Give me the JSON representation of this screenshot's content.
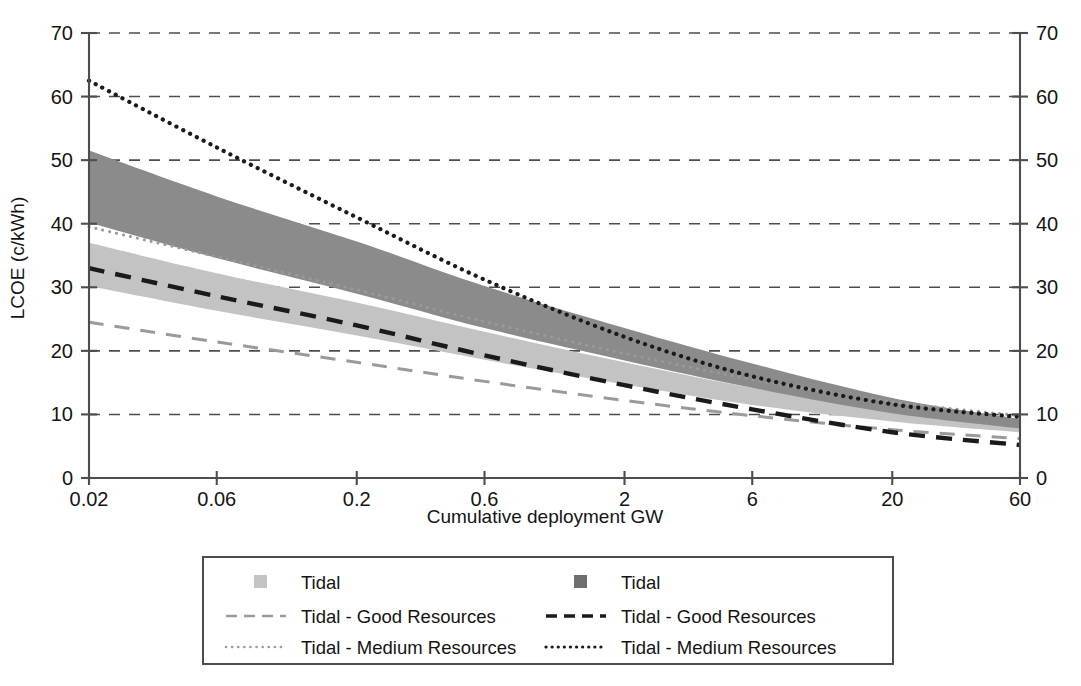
{
  "chart_data": {
    "type": "area",
    "title": "",
    "xlabel": "Cumulative deployment GW",
    "ylabel": "LCOE (c/kWh)",
    "xscale": "log",
    "xlim": [
      0.02,
      60
    ],
    "ylim": [
      0,
      70
    ],
    "grid": true,
    "xticks": [
      "0.02",
      "0.06",
      "0.2",
      "0.6",
      "2",
      "6",
      "20",
      "60"
    ],
    "xtick_values": [
      0.02,
      0.06,
      0.2,
      0.6,
      2,
      6,
      20,
      60
    ],
    "yticks": [
      "0",
      "10",
      "20",
      "30",
      "40",
      "50",
      "60",
      "70"
    ],
    "ytick_values": [
      0,
      10,
      20,
      30,
      40,
      50,
      60,
      70
    ],
    "yticks_right": [
      "0",
      "10",
      "20",
      "30",
      "40",
      "50",
      "60",
      "70"
    ],
    "legend_position": "below",
    "colors": {
      "band_light": "#c3c3c3",
      "band_dark": "#8b8b8b",
      "line_light": "#9a9a9a",
      "line_dark": "#1a1a1a",
      "axis": "#4d4d4d",
      "grid": "#4d4d4d",
      "text": "#141414",
      "legend_border": "#4d4d4d",
      "background": "#ffffff"
    },
    "series": [
      {
        "name": "Tidal",
        "type": "band",
        "style": "light-fill",
        "color": "#c3c3c3",
        "x": [
          0.02,
          0.06,
          0.2,
          0.6,
          2,
          6,
          20,
          60
        ],
        "upper": [
          37.0,
          32.2,
          27.6,
          23.0,
          18.2,
          14.2,
          10.8,
          8.6
        ],
        "lower": [
          30.2,
          26.3,
          22.4,
          18.6,
          14.7,
          11.5,
          8.9,
          7.2
        ]
      },
      {
        "name": "Tidal",
        "type": "band",
        "style": "dark-fill",
        "color": "#8b8b8b",
        "x": [
          0.02,
          0.06,
          0.2,
          0.6,
          2,
          6,
          20,
          60
        ],
        "upper": [
          51.5,
          44.3,
          37.2,
          30.2,
          23.6,
          18.0,
          12.6,
          9.3
        ],
        "lower": [
          40.2,
          34.6,
          29.0,
          23.6,
          18.5,
          14.2,
          10.2,
          7.8
        ]
      },
      {
        "name": "Tidal - Good Resources",
        "type": "line",
        "style": "dashed",
        "color": "#9a9a9a",
        "x": [
          0.02,
          0.06,
          0.2,
          0.6,
          2,
          6,
          20,
          60
        ],
        "values": [
          24.5,
          21.4,
          18.2,
          15.2,
          12.2,
          9.8,
          7.6,
          6.2
        ]
      },
      {
        "name": "Tidal - Good Resources",
        "type": "line",
        "style": "dashed",
        "color": "#1a1a1a",
        "x": [
          0.02,
          0.06,
          0.2,
          0.6,
          2,
          6,
          20,
          60
        ],
        "values": [
          33.0,
          28.6,
          24.0,
          19.3,
          14.6,
          10.8,
          7.2,
          5.2
        ]
      },
      {
        "name": "Tidal - Medium Resources",
        "type": "line",
        "style": "dotted",
        "color": "#9a9a9a",
        "x": [
          0.02,
          0.06,
          0.2,
          0.6,
          2,
          6,
          20,
          60
        ],
        "values": [
          39.5,
          34.8,
          29.6,
          24.6,
          19.6,
          15.5,
          12.0,
          9.8
        ]
      },
      {
        "name": "Tidal - Medium Resources",
        "type": "line",
        "style": "dotted",
        "color": "#1a1a1a",
        "x": [
          0.02,
          0.06,
          0.2,
          0.6,
          2,
          6,
          20,
          60
        ],
        "values": [
          62.5,
          52.0,
          41.0,
          31.2,
          22.2,
          16.0,
          11.6,
          9.6
        ]
      }
    ],
    "legend": {
      "columns": [
        {
          "key": "light",
          "entries": [
            {
              "label": "Tidal",
              "marker": "square",
              "color": "#c3c3c3"
            },
            {
              "label": "Tidal - Good Resources",
              "marker": "dashed-line",
              "color": "#9a9a9a"
            },
            {
              "label": "Tidal - Medium Resources",
              "marker": "dotted-line",
              "color": "#9a9a9a"
            }
          ]
        },
        {
          "key": "dark",
          "entries": [
            {
              "label": "Tidal",
              "marker": "square",
              "color": "#6e6e6e"
            },
            {
              "label": "Tidal - Good Resources",
              "marker": "dashed-line",
              "color": "#1a1a1a"
            },
            {
              "label": "Tidal - Medium Resources",
              "marker": "dotted-line",
              "color": "#1a1a1a"
            }
          ]
        }
      ]
    }
  }
}
